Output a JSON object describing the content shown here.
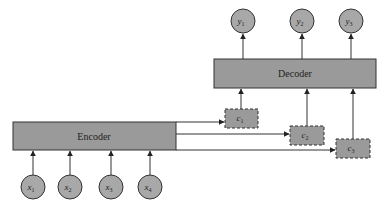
{
  "diagram": {
    "type": "encoder-decoder",
    "colors": {
      "box_fill": "#9a9a9a",
      "circle_fill": "#a8a8a8",
      "stroke": "#333333",
      "background": "#ffffff"
    },
    "encoder": {
      "label": "Encoder"
    },
    "decoder": {
      "label": "Decoder"
    },
    "inputs": [
      {
        "name": "x",
        "sub": "1"
      },
      {
        "name": "x",
        "sub": "2"
      },
      {
        "name": "x",
        "sub": "3"
      },
      {
        "name": "x",
        "sub": "4"
      }
    ],
    "outputs": [
      {
        "name": "y",
        "sub": "1"
      },
      {
        "name": "y",
        "sub": "2"
      },
      {
        "name": "y",
        "sub": "3"
      }
    ],
    "contexts": [
      {
        "name": "c",
        "sub": "1"
      },
      {
        "name": "c",
        "sub": "2"
      },
      {
        "name": "c",
        "sub": "3"
      }
    ]
  }
}
